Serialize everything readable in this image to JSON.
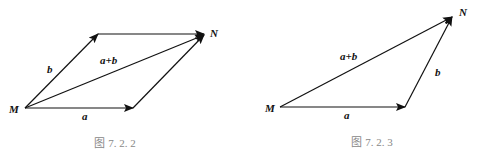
{
  "figures": [
    {
      "id": "fig-7-2-2",
      "caption": "图 7. 2. 2",
      "type": "parallelogram-rule",
      "points": {
        "M": "M",
        "N": "N"
      },
      "vectors": {
        "a": "a",
        "b": "b",
        "sum": "a+b"
      }
    },
    {
      "id": "fig-7-2-3",
      "caption": "图 7. 2. 3",
      "type": "triangle-rule",
      "points": {
        "M": "M",
        "N": "N"
      },
      "vectors": {
        "a": "a",
        "b": "b",
        "sum": "a+b"
      }
    }
  ]
}
